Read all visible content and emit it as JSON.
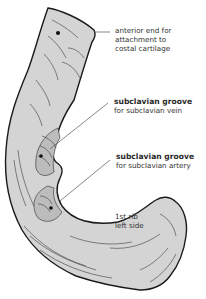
{
  "figure": {
    "title": "1st rib left side",
    "colors": {
      "bone_fill": "#d4d4d4",
      "outline": "#1a1a1a",
      "hatching": "#3a3a3a",
      "leader_line": "#555555",
      "text": "#333333",
      "background": "#ffffff"
    }
  },
  "labels": {
    "anterior_end": {
      "lines": [
        "anterior end for",
        "attachment to",
        "costal cartilage"
      ]
    },
    "groove_vein": {
      "title": "subclavian groove",
      "subtitle": "for subclavian vein"
    },
    "groove_artery": {
      "title": "subclavian groove",
      "subtitle": "for subclavian artery"
    },
    "caption": {
      "lines": [
        "1st rib",
        "left side"
      ]
    }
  }
}
